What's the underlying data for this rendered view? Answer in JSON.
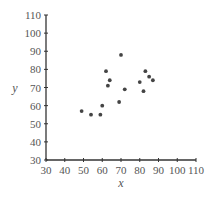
{
  "chart_data": {
    "type": "scatter",
    "title": "",
    "xlabel": "x",
    "ylabel": "y",
    "xlim": [
      30,
      110
    ],
    "ylim": [
      30,
      110
    ],
    "xticks": [
      30,
      40,
      50,
      60,
      70,
      80,
      90,
      100,
      110
    ],
    "yticks": [
      30,
      40,
      50,
      60,
      70,
      80,
      90,
      100,
      110
    ],
    "grid": false,
    "legend": null,
    "series": [
      {
        "name": "points",
        "color": "#444444",
        "points": [
          {
            "x": 49,
            "y": 57
          },
          {
            "x": 54,
            "y": 55
          },
          {
            "x": 59,
            "y": 55
          },
          {
            "x": 60,
            "y": 60
          },
          {
            "x": 69,
            "y": 62
          },
          {
            "x": 62,
            "y": 79
          },
          {
            "x": 63,
            "y": 71
          },
          {
            "x": 64,
            "y": 74
          },
          {
            "x": 70,
            "y": 88
          },
          {
            "x": 72,
            "y": 69
          },
          {
            "x": 80,
            "y": 73
          },
          {
            "x": 82,
            "y": 68
          },
          {
            "x": 83,
            "y": 79
          },
          {
            "x": 85,
            "y": 76
          },
          {
            "x": 87,
            "y": 74
          }
        ]
      }
    ]
  },
  "colors": {
    "axis": "#333333",
    "text": "#555555",
    "point": "#444444",
    "background": "#ffffff"
  }
}
